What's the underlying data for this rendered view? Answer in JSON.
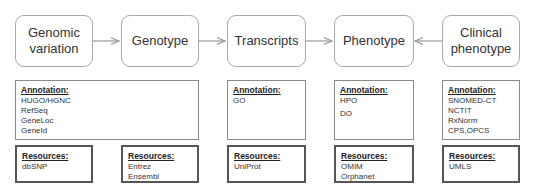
{
  "nodes": [
    {
      "label": "Genomic\nvariation"
    },
    {
      "label": "Genotype"
    },
    {
      "label": "Transcripts"
    },
    {
      "label": "Phenotype"
    },
    {
      "label": "Clinical\nphenotype"
    }
  ],
  "annotation_header": "Annotation:",
  "resources_header": "Resources:",
  "annotations": [
    {
      "items": [
        "HUGO/HGNC",
        "RefSeq",
        "GeneLoc",
        "GeneId"
      ]
    },
    {
      "items": [
        "GO"
      ]
    },
    {
      "items": [
        "HPO",
        "DO"
      ]
    },
    {
      "items": [
        "SNOMED-CT",
        "NCTIT",
        "RxNorm",
        "CPS,OPCS"
      ]
    }
  ],
  "resources": [
    {
      "items": [
        "dbSNP"
      ]
    },
    {
      "items": [
        "Entrez",
        "Ensembl"
      ]
    },
    {
      "items": [
        "UniProt"
      ]
    },
    {
      "items": [
        "OMIM",
        "Orphanet"
      ]
    },
    {
      "items": [
        "UMLS"
      ]
    }
  ],
  "edges": [
    {
      "from": "Genomic variation",
      "to": "Genotype"
    },
    {
      "from": "Genotype",
      "to": "Transcripts"
    },
    {
      "from": "Transcripts",
      "to": "Phenotype"
    },
    {
      "from": "Clinical phenotype",
      "to": "Phenotype"
    }
  ],
  "colors": {
    "node_border": "#a9a9a9",
    "arrow": "#999999",
    "resource_border": "#555555"
  }
}
